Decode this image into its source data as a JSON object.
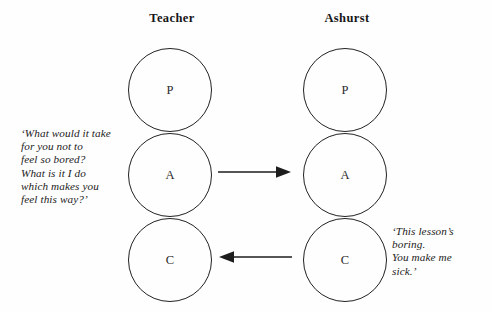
{
  "diagram": {
    "type": "transactional-analysis-pac",
    "background_color": "#fefefe",
    "stroke_color": "#222222",
    "columns": [
      {
        "id": "teacher",
        "label": "Teacher",
        "ego_states": [
          {
            "id": "parent",
            "letter": "P"
          },
          {
            "id": "adult",
            "letter": "A"
          },
          {
            "id": "child",
            "letter": "C"
          }
        ]
      },
      {
        "id": "ashurst",
        "label": "Ashurst",
        "ego_states": [
          {
            "id": "parent",
            "letter": "P"
          },
          {
            "id": "adult",
            "letter": "A"
          },
          {
            "id": "child",
            "letter": "C"
          }
        ]
      }
    ],
    "arrows": [
      {
        "id": "adult-to-adult",
        "direction": "right",
        "from": "teacher-adult",
        "to": "ashurst-adult"
      },
      {
        "id": "child-to-child",
        "direction": "left",
        "from": "ashurst-child",
        "to": "teacher-child"
      }
    ],
    "quotes": {
      "teacher": "‘What would it take\nfor you not to\nfeel so bored?\nWhat is it I do\nwhich makes you\nfeel this way?’",
      "ashurst": "‘This lesson’s\nboring.\nYou make me\nsick.’"
    }
  }
}
